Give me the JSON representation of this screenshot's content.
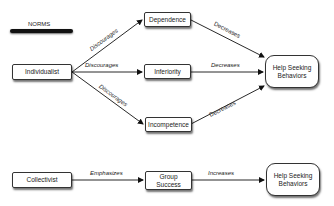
{
  "diagram": {
    "title": "NORMS",
    "nodes": {
      "individualist": "Individualist",
      "dependence": "Dependence",
      "inferiority": "Inferiority",
      "incompetence": "Incompetence",
      "help_top": "Help Seeking Behaviors",
      "collectivist": "Collectivist",
      "group_success": "Group Success",
      "help_bottom": "Help Seeking Behaviors"
    },
    "edges": [
      {
        "from": "Individualist",
        "to": "Dependence",
        "label": "Discourages"
      },
      {
        "from": "Individualist",
        "to": "Inferiority",
        "label": "Discourages"
      },
      {
        "from": "Individualist",
        "to": "Incompetence",
        "label": "Discourages"
      },
      {
        "from": "Dependence",
        "to": "Help Seeking Behaviors",
        "label": "Decreases"
      },
      {
        "from": "Inferiority",
        "to": "Help Seeking Behaviors",
        "label": "Decreases"
      },
      {
        "from": "Incompetence",
        "to": "Help Seeking Behaviors",
        "label": "Decreases"
      },
      {
        "from": "Collectivist",
        "to": "Group Success",
        "label": "Emphasizes"
      },
      {
        "from": "Group Success",
        "to": "Help Seeking Behaviors",
        "label": "Increases"
      }
    ]
  }
}
